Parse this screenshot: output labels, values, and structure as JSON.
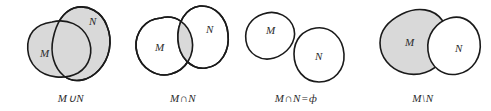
{
  "figure": {
    "background_color": "#ffffff",
    "stroke_color": "#1a1a1a",
    "shade_color": "#d9d9d9",
    "text_color": "#2b2b2b"
  },
  "diagrams": [
    {
      "id": "union",
      "caption": "M∪N",
      "set_m_label": "M",
      "set_n_label": "N",
      "relationship": "overlapping",
      "shaded_region": "both-sets"
    },
    {
      "id": "intersection",
      "caption": "M∩N",
      "set_m_label": "M",
      "set_n_label": "N",
      "relationship": "overlapping",
      "shaded_region": "overlap-only"
    },
    {
      "id": "disjoint",
      "caption": "M∩N=ф",
      "set_m_label": "M",
      "set_n_label": "N",
      "relationship": "disjoint",
      "shaded_region": "none"
    },
    {
      "id": "difference",
      "caption": "M\\N",
      "set_m_label": "M",
      "set_n_label": "N",
      "relationship": "overlapping",
      "shaded_region": "m-minus-n"
    }
  ]
}
